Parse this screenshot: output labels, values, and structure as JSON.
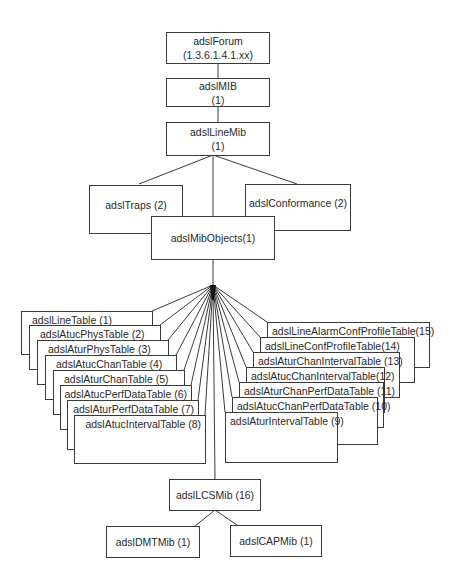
{
  "diagram": {
    "type": "MIB tree",
    "root": {
      "name": "adslForum",
      "oid": "(1.3.6.1.4.1.xx)"
    },
    "adslMIB": {
      "name": "adslMIB",
      "index": "(1)"
    },
    "adslLineMib": {
      "name": "adslLineMib",
      "index": "(1)"
    },
    "adslTraps": {
      "label": "adslTraps (2)"
    },
    "adslConformance": {
      "label": "adslConformance (2)"
    },
    "adslMibObjects": {
      "label": "adslMibObjects(1)"
    },
    "left_tables": [
      {
        "label": "adslLineTable (1)"
      },
      {
        "label": "adslAtucPhysTable (2)"
      },
      {
        "label": "adslAturPhysTable (3)"
      },
      {
        "label": "adslAtucChanTable (4)"
      },
      {
        "label": "adslAturChanTable (5)"
      },
      {
        "label": "adslAtucPerfDataTable (6)"
      },
      {
        "label": "adslAturPerfDataTable (7)"
      },
      {
        "label": "adslAtucIntervalTable (8)"
      }
    ],
    "right_tables": [
      {
        "label": "adslLineAlarmConfProfileTable(15)"
      },
      {
        "label": "adslLineConfProfileTable(14)"
      },
      {
        "label": "adslAturChanIntervalTable (13)"
      },
      {
        "label": "adslAtucChanIntervalTable(12)"
      },
      {
        "label": "adslAturChanPerfDataTable (11)"
      },
      {
        "label": "adslAtucChanPerfDataTable (10)"
      },
      {
        "label": "adslAturIntervalTable (9)"
      }
    ],
    "adslLCSMib": {
      "label": "adslLCSMib (16)"
    },
    "adslDMTMib": {
      "label": "adslDMTMib (1)"
    },
    "adslCAPMib": {
      "label": "adslCAPMib (1)"
    },
    "colors": {
      "line": "#3a3a3a",
      "text": "#2a2a2a",
      "background": "#ffffff"
    }
  }
}
